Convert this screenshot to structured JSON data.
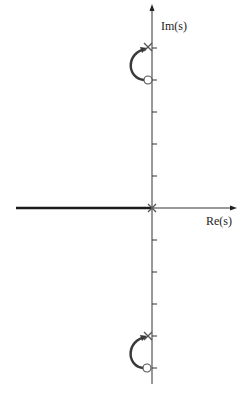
{
  "diagram": {
    "axes": {
      "imag_label": "Im(s)",
      "real_label": "Re(s)"
    },
    "poles": [
      {
        "label": "pole-upper",
        "re": 0,
        "im": 5
      },
      {
        "label": "pole-origin",
        "re": 0,
        "im": 0
      },
      {
        "label": "pole-lower",
        "re": 0,
        "im": -4
      }
    ],
    "zeros": [
      {
        "label": "zero-upper",
        "re": 0,
        "im": 4
      },
      {
        "label": "zero-lower",
        "re": 0,
        "im": -5
      }
    ],
    "branches": [
      {
        "from": "pole-upper",
        "to": "zero-upper",
        "shape": "arc-left"
      },
      {
        "from": "pole-lower",
        "to": "zero-lower",
        "shape": "arc-left"
      },
      {
        "from": "pole-origin",
        "to": "-infinity",
        "shape": "real-axis"
      }
    ],
    "ticks_imag": [
      5,
      4,
      3,
      2,
      1,
      -1,
      -2,
      -3,
      -4,
      -5
    ],
    "colors": {
      "axis": "#333333",
      "locus": "#3a3a3a",
      "marker": "#555555"
    }
  }
}
